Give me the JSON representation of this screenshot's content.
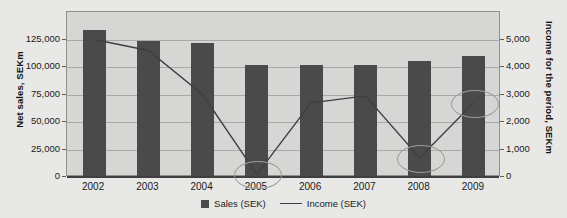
{
  "chart_data": {
    "type": "bar",
    "title": "",
    "xlabel": "",
    "ylabel": "Net sales, SEKm",
    "y2label": "Income for the period, SEKm",
    "categories": [
      "2002",
      "2003",
      "2004",
      "2005",
      "2006",
      "2007",
      "2008",
      "2009"
    ],
    "grid": true,
    "legend_position": "bottom",
    "ylim": [
      0,
      150000
    ],
    "y2lim": [
      0,
      6000
    ],
    "yticks": [
      "0",
      "25,000",
      "50,000",
      "75,000",
      "100,000",
      "125,000"
    ],
    "ytick_values": [
      0,
      25000,
      50000,
      75000,
      100000,
      125000
    ],
    "y2ticks": [
      "0",
      "1,000",
      "2,000",
      "3,000",
      "4,000",
      "5,000"
    ],
    "y2tick_values": [
      0,
      1000,
      2000,
      3000,
      4000,
      5000
    ],
    "series": [
      {
        "name": "Sales (SEK)",
        "type": "bar",
        "axis": "left",
        "unit": "SEKm",
        "color": "#4a4a4a",
        "values": [
          134000,
          124000,
          121500,
          101500,
          102000,
          102000,
          105500,
          110000
        ]
      },
      {
        "name": "Income (SEK)",
        "type": "line",
        "axis": "right",
        "unit": "SEKm",
        "color": "#3f3f3f",
        "values": [
          5000,
          4600,
          3000,
          100,
          2700,
          2950,
          700,
          2700
        ]
      }
    ],
    "annotations": [
      {
        "label": "highlight-2005-income-low",
        "category": "2005",
        "shape": "ellipse"
      },
      {
        "label": "highlight-2008-income-dip",
        "category": "2008",
        "shape": "ellipse"
      },
      {
        "label": "highlight-2009-income-recovery",
        "category": "2009",
        "shape": "ellipse"
      }
    ]
  },
  "legend": {
    "items": [
      {
        "label": "Sales (SEK)",
        "glyph": "square-swatch"
      },
      {
        "label": "Income (SEK)",
        "glyph": "line-swatch"
      }
    ]
  },
  "top_cropped_text": ""
}
